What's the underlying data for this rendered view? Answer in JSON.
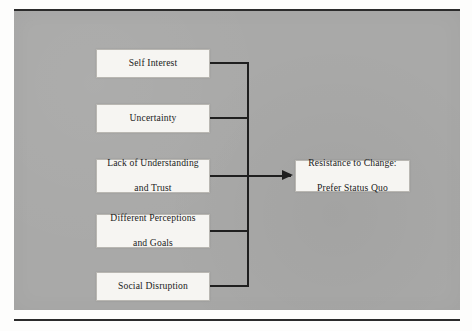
{
  "figure": {
    "background_color": "#a9a9a8",
    "frame_rule_color": "#2b2b2b",
    "node_fill_color": "#f6f5f2",
    "connector_color": "#1f1f1f"
  },
  "diagram": {
    "type": "cause-effect-flow",
    "causes": [
      {
        "id": "self-interest",
        "label": "Self Interest"
      },
      {
        "id": "uncertainty",
        "label": "Uncertainty"
      },
      {
        "id": "lack-understanding",
        "label": "Lack of Understanding\nand Trust",
        "line1": "Lack of Understanding",
        "line2": "and Trust"
      },
      {
        "id": "different-perceptions",
        "label": "Different Perceptions\nand Goals",
        "line1": "Different Perceptions",
        "line2": "and Goals"
      },
      {
        "id": "social-disruption",
        "label": "Social Disruption"
      }
    ],
    "effect": {
      "id": "resistance-to-change",
      "line1": "Resistance to Change:",
      "line2": "Prefer Status Quo"
    },
    "connector": {
      "style": "orthogonal-bus-with-arrow",
      "arrowhead": "solid-triangle",
      "direction": "left-to-right"
    }
  }
}
